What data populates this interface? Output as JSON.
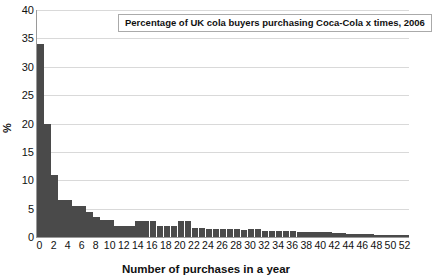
{
  "chart_data": {
    "type": "bar",
    "title": "Percentage of UK cola buyers purchasing Coca-Cola x times, 2006",
    "xlabel": "Number of purchases in a year",
    "ylabel": "%",
    "ylim": [
      0,
      40
    ],
    "xlim": [
      0,
      53
    ],
    "grid": true,
    "legend": "none",
    "bar_color": "#4a4a4a",
    "ytick_labels": [
      "0",
      "5",
      "10",
      "15",
      "20",
      "25",
      "30",
      "35",
      "40"
    ],
    "ytick_values": [
      0,
      5,
      10,
      15,
      20,
      25,
      30,
      35,
      40
    ],
    "xtick_labels": [
      "0",
      "2",
      "4",
      "6",
      "8",
      "10",
      "12",
      "14",
      "16",
      "18",
      "20",
      "22",
      "24",
      "26",
      "28",
      "30",
      "32",
      "34",
      "36",
      "38",
      "40",
      "42",
      "44",
      "46",
      "48",
      "50",
      "52"
    ],
    "xtick_values": [
      0,
      2,
      4,
      6,
      8,
      10,
      12,
      14,
      16,
      18,
      20,
      22,
      24,
      26,
      28,
      30,
      32,
      34,
      36,
      38,
      40,
      42,
      44,
      46,
      48,
      50,
      52
    ],
    "categories": [
      0,
      1,
      2,
      3,
      4,
      5,
      6,
      7,
      8,
      9,
      10,
      11,
      12,
      13,
      14,
      15,
      16,
      17,
      18,
      19,
      20,
      21,
      22,
      23,
      24,
      25,
      26,
      27,
      28,
      29,
      30,
      31,
      32,
      33,
      34,
      35,
      36,
      37,
      38,
      39,
      40,
      41,
      42,
      43,
      44,
      45,
      46,
      47,
      48,
      49,
      50,
      51,
      52
    ],
    "values": [
      34.0,
      20.0,
      11.0,
      6.6,
      6.6,
      5.4,
      5.4,
      4.4,
      3.6,
      3.0,
      3.0,
      2.0,
      2.0,
      2.0,
      2.9,
      2.9,
      2.9,
      2.0,
      2.0,
      1.9,
      2.8,
      2.8,
      1.6,
      1.6,
      1.5,
      1.5,
      1.5,
      1.4,
      1.4,
      1.3,
      1.5,
      1.5,
      1.1,
      1.1,
      1.0,
      1.0,
      1.0,
      0.9,
      0.9,
      0.9,
      0.8,
      0.8,
      0.7,
      0.7,
      0.6,
      0.6,
      0.5,
      0.5,
      0.4,
      0.4,
      0.3,
      0.3,
      0.3
    ]
  }
}
